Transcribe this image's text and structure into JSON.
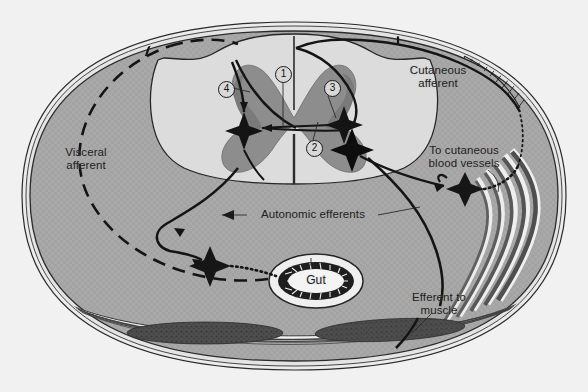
{
  "figure": {
    "background_color": "#f2f2f2",
    "body_fill": "#a8a8a8",
    "cord_white_matter": "#d9d9d9",
    "cord_gray_matter": "#8a8a8a",
    "muscle_color": "#4a4a4a",
    "line_color": "#161616"
  },
  "labels": {
    "visceral_afferent": "Visceral\nafferent",
    "cutaneous_afferent": "Cutaneous\nafferent",
    "to_cutaneous_blood_vessels": "To cutaneous\nblood vessels",
    "autonomic_efferents": "Autonomic efferents",
    "efferent_to_muscle": "Efferent to\nmuscle",
    "gut": "Gut"
  },
  "markers": [
    {
      "id": "marker-1",
      "text": "1",
      "x": 275,
      "y": 66
    },
    {
      "id": "marker-2",
      "text": "2",
      "x": 306,
      "y": 140
    },
    {
      "id": "marker-3",
      "text": "3",
      "x": 324,
      "y": 80
    },
    {
      "id": "marker-4",
      "text": "4",
      "x": 218,
      "y": 81
    }
  ]
}
